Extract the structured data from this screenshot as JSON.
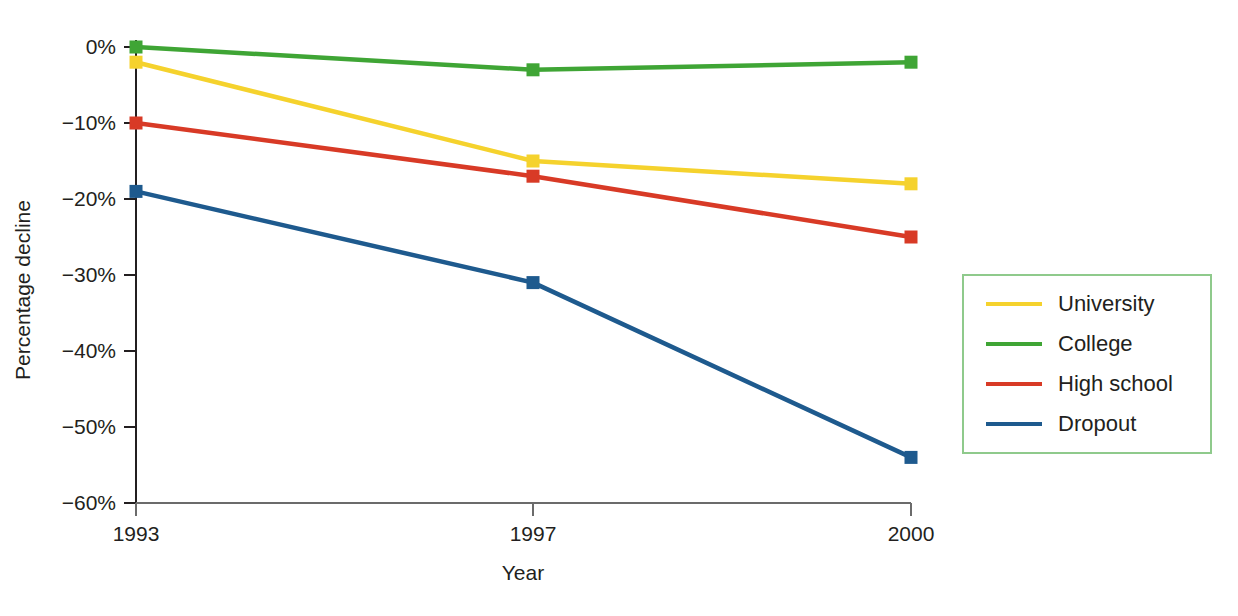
{
  "chart_data": {
    "type": "line",
    "title": "",
    "xlabel": "Year",
    "ylabel": "Percentage decline",
    "categories": [
      "1993",
      "1997",
      "2000"
    ],
    "x": [
      1993,
      1997,
      2000
    ],
    "x_positions_px": [
      136,
      533,
      911
    ],
    "ylim": [
      -60,
      0
    ],
    "yticks": [
      0,
      -10,
      -20,
      -30,
      -40,
      -50,
      -60
    ],
    "ytick_labels": [
      "0%",
      "−10%",
      "−20%",
      "−30%",
      "−40%",
      "−50%",
      "−60%"
    ],
    "xtick_labels": [
      "1993",
      "1997",
      "2000"
    ],
    "grid": false,
    "legend_position": "right",
    "markers": "square",
    "series": [
      {
        "name": "University",
        "values": [
          -2,
          -15,
          -18
        ],
        "color": "#F5D22D"
      },
      {
        "name": "College",
        "values": [
          0,
          -3,
          -2
        ],
        "color": "#3FA535"
      },
      {
        "name": "High school",
        "values": [
          -10,
          -17,
          -25
        ],
        "color": "#D83A26"
      },
      {
        "name": "Dropout",
        "values": [
          -19,
          -31,
          -54
        ],
        "color": "#1E5A8E"
      }
    ]
  },
  "axes": {
    "y_title": "Percentage decline",
    "x_title": "Year"
  },
  "legend": {
    "border_color": "#8fca8c",
    "items": [
      {
        "label": "University",
        "color": "#F5D22D"
      },
      {
        "label": "College",
        "color": "#3FA535"
      },
      {
        "label": "High school",
        "color": "#D83A26"
      },
      {
        "label": "Dropout",
        "color": "#1E5A8E"
      }
    ]
  },
  "colors": {
    "university": "#F5D22D",
    "college": "#3FA535",
    "high_school": "#D83A26",
    "dropout": "#1E5A8E",
    "axis": "#231f20",
    "legend_border": "#8fca8c",
    "background": "#ffffff"
  }
}
